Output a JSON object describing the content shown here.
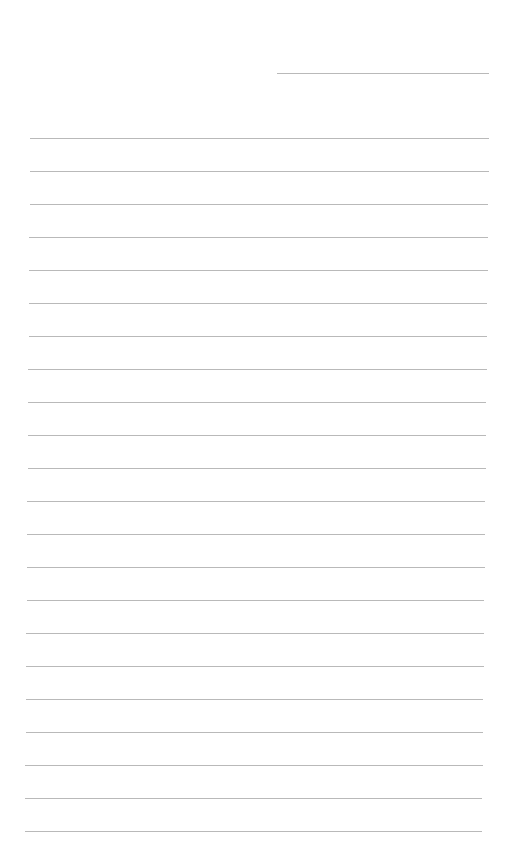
{
  "document": {
    "type": "lined-paper",
    "background_color": "#ffffff",
    "line_color": "#b9b9b9",
    "header_line": {
      "x1": 277,
      "x2": 489,
      "y": 73
    },
    "lines": {
      "count": 22,
      "first_y": 138,
      "spacing": 33,
      "x_left_top": 30,
      "x_left_bottom": 25,
      "x_right_top": 489,
      "x_right_bottom": 482
    }
  }
}
